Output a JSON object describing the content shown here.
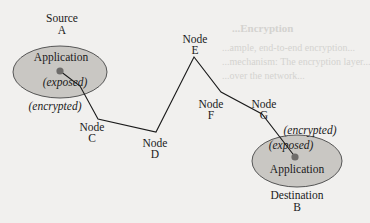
{
  "colors": {
    "background": "#f1f0ee",
    "ellipse_fill": "#c9c7c3",
    "ellipse_stroke": "#555555",
    "line": "#1a1a1a",
    "dot": "#6e6c6a",
    "bleed_text": "#d4d3d0"
  },
  "source": {
    "title": "Source",
    "id": "A",
    "app_label": "Application",
    "state_label": "(exposed)"
  },
  "destination": {
    "title": "Destination",
    "id": "B",
    "app_label": "Application",
    "state_label": "(exposed)"
  },
  "link_labels": {
    "source_side": "(encrypted)",
    "destination_side": "(encrypted)"
  },
  "nodes": [
    {
      "word": "Node",
      "id": "C"
    },
    {
      "word": "Node",
      "id": "D"
    },
    {
      "word": "Node",
      "id": "E"
    },
    {
      "word": "Node",
      "id": "F"
    },
    {
      "word": "Node",
      "id": "G"
    }
  ],
  "bleed_through": {
    "heading": "...Encryption",
    "line1": "...ample, end-to-end encryption...",
    "line2": "...mechanism: The encryption layer...",
    "line3": "...over the network..."
  }
}
